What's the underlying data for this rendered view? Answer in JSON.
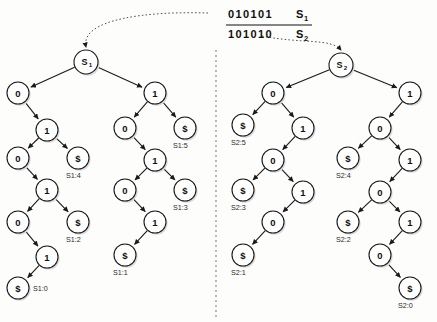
{
  "figure": {
    "width": 437,
    "height": 322,
    "colors": {
      "ink": "#1a1a1a",
      "shadow": "#d9d9d9",
      "divider": "#777777",
      "background": "#fdfdfc"
    }
  },
  "header": {
    "string1": {
      "bits": "010101",
      "name": "S",
      "sub": "1"
    },
    "string2": {
      "bits": "101010",
      "name": "S",
      "sub": "2"
    }
  },
  "roots": {
    "left": {
      "name": "S",
      "sub": "1"
    },
    "right": {
      "name": "S",
      "sub": "2"
    }
  },
  "tree_left": {
    "id": "S1",
    "nodes": [
      {
        "id": "L-root",
        "label": "S1",
        "x": 86,
        "y": 62,
        "r": 12,
        "kind": "root"
      },
      {
        "id": "L-a",
        "label": "0",
        "x": 18,
        "y": 93,
        "r": 11,
        "kind": "internal"
      },
      {
        "id": "L-b",
        "label": "1",
        "x": 47,
        "y": 130,
        "r": 11,
        "kind": "internal"
      },
      {
        "id": "L-c",
        "label": "0",
        "x": 18,
        "y": 158,
        "r": 11,
        "kind": "internal"
      },
      {
        "id": "L-d",
        "label": "$",
        "x": 78,
        "y": 158,
        "r": 11,
        "kind": "leaf",
        "leaf_label": "S1:4"
      },
      {
        "id": "L-e",
        "label": "1",
        "x": 47,
        "y": 190,
        "r": 11,
        "kind": "internal"
      },
      {
        "id": "L-f",
        "label": "0",
        "x": 18,
        "y": 222,
        "r": 11,
        "kind": "internal"
      },
      {
        "id": "L-g",
        "label": "$",
        "x": 78,
        "y": 222,
        "r": 11,
        "kind": "leaf",
        "leaf_label": "S1:2"
      },
      {
        "id": "L-h",
        "label": "1",
        "x": 47,
        "y": 257,
        "r": 11,
        "kind": "internal"
      },
      {
        "id": "L-i",
        "label": "$",
        "x": 18,
        "y": 288,
        "r": 11,
        "kind": "leaf",
        "leaf_label": "S1:0"
      },
      {
        "id": "R-a",
        "label": "1",
        "x": 155,
        "y": 93,
        "r": 11,
        "kind": "internal"
      },
      {
        "id": "R-b",
        "label": "0",
        "x": 125,
        "y": 128,
        "r": 11,
        "kind": "internal"
      },
      {
        "id": "R-c",
        "label": "$",
        "x": 185,
        "y": 128,
        "r": 11,
        "kind": "leaf",
        "leaf_label": "S1:5"
      },
      {
        "id": "R-d",
        "label": "1",
        "x": 155,
        "y": 160,
        "r": 11,
        "kind": "internal"
      },
      {
        "id": "R-e",
        "label": "0",
        "x": 125,
        "y": 190,
        "r": 11,
        "kind": "internal"
      },
      {
        "id": "R-f",
        "label": "$",
        "x": 185,
        "y": 190,
        "r": 11,
        "kind": "leaf",
        "leaf_label": "S1:3"
      },
      {
        "id": "R-g",
        "label": "1",
        "x": 155,
        "y": 222,
        "r": 11,
        "kind": "internal"
      },
      {
        "id": "R-h",
        "label": "$",
        "x": 125,
        "y": 255,
        "r": 11,
        "kind": "leaf",
        "leaf_label": "S1:1"
      }
    ],
    "edges": [
      [
        "L-root",
        "L-a"
      ],
      [
        "L-root",
        "R-a"
      ],
      [
        "L-a",
        "L-b"
      ],
      [
        "L-b",
        "L-c"
      ],
      [
        "L-b",
        "L-d"
      ],
      [
        "L-c",
        "L-e"
      ],
      [
        "L-e",
        "L-f"
      ],
      [
        "L-e",
        "L-g"
      ],
      [
        "L-f",
        "L-h"
      ],
      [
        "L-h",
        "L-i"
      ],
      [
        "R-a",
        "R-b"
      ],
      [
        "R-a",
        "R-c"
      ],
      [
        "R-b",
        "R-d"
      ],
      [
        "R-d",
        "R-e"
      ],
      [
        "R-d",
        "R-f"
      ],
      [
        "R-e",
        "R-g"
      ],
      [
        "R-g",
        "R-h"
      ]
    ]
  },
  "tree_right": {
    "id": "S2",
    "nodes": [
      {
        "id": "X-root",
        "label": "S2",
        "x": 341,
        "y": 65,
        "r": 12,
        "kind": "root"
      },
      {
        "id": "X-a",
        "label": "0",
        "x": 273,
        "y": 93,
        "r": 11,
        "kind": "internal"
      },
      {
        "id": "X-b",
        "label": "$",
        "x": 243,
        "y": 125,
        "r": 11,
        "kind": "leaf",
        "leaf_label": "S2:5"
      },
      {
        "id": "X-c",
        "label": "1",
        "x": 303,
        "y": 128,
        "r": 11,
        "kind": "internal"
      },
      {
        "id": "X-d",
        "label": "0",
        "x": 273,
        "y": 160,
        "r": 11,
        "kind": "internal"
      },
      {
        "id": "X-e",
        "label": "$",
        "x": 243,
        "y": 190,
        "r": 11,
        "kind": "leaf",
        "leaf_label": "S2:3"
      },
      {
        "id": "X-f",
        "label": "1",
        "x": 303,
        "y": 192,
        "r": 11,
        "kind": "internal"
      },
      {
        "id": "X-g",
        "label": "0",
        "x": 273,
        "y": 222,
        "r": 11,
        "kind": "internal"
      },
      {
        "id": "X-h",
        "label": "$",
        "x": 243,
        "y": 255,
        "r": 11,
        "kind": "leaf",
        "leaf_label": "S2:1"
      },
      {
        "id": "Y-a",
        "label": "1",
        "x": 410,
        "y": 93,
        "r": 11,
        "kind": "internal"
      },
      {
        "id": "Y-b",
        "label": "0",
        "x": 380,
        "y": 128,
        "r": 11,
        "kind": "internal"
      },
      {
        "id": "Y-c",
        "label": "$",
        "x": 348,
        "y": 158,
        "r": 11,
        "kind": "leaf",
        "leaf_label": "S2:4"
      },
      {
        "id": "Y-d",
        "label": "1",
        "x": 410,
        "y": 160,
        "r": 11,
        "kind": "internal"
      },
      {
        "id": "Y-e",
        "label": "0",
        "x": 380,
        "y": 192,
        "r": 11,
        "kind": "internal"
      },
      {
        "id": "Y-f",
        "label": "$",
        "x": 348,
        "y": 222,
        "r": 11,
        "kind": "leaf",
        "leaf_label": "S2:2"
      },
      {
        "id": "Y-g",
        "label": "1",
        "x": 410,
        "y": 222,
        "r": 11,
        "kind": "internal"
      },
      {
        "id": "Y-h",
        "label": "0",
        "x": 380,
        "y": 255,
        "r": 11,
        "kind": "internal"
      },
      {
        "id": "Y-i",
        "label": "$",
        "x": 410,
        "y": 288,
        "r": 11,
        "kind": "leaf",
        "leaf_label": "S2:0"
      }
    ],
    "edges": [
      [
        "X-root",
        "X-a"
      ],
      [
        "X-root",
        "Y-a"
      ],
      [
        "X-a",
        "X-b"
      ],
      [
        "X-a",
        "X-c"
      ],
      [
        "X-c",
        "X-d"
      ],
      [
        "X-d",
        "X-e"
      ],
      [
        "X-d",
        "X-f"
      ],
      [
        "X-f",
        "X-g"
      ],
      [
        "X-g",
        "X-h"
      ],
      [
        "Y-a",
        "Y-b"
      ],
      [
        "Y-b",
        "Y-c"
      ],
      [
        "Y-b",
        "Y-d"
      ],
      [
        "Y-d",
        "Y-e"
      ],
      [
        "Y-e",
        "Y-f"
      ],
      [
        "Y-e",
        "Y-g"
      ],
      [
        "Y-g",
        "Y-h"
      ],
      [
        "Y-h",
        "Y-i"
      ]
    ]
  },
  "divider": {
    "x": 216,
    "y1": 50,
    "y2": 320
  },
  "pointers": [
    {
      "name": "pointer-to-s1",
      "from_x": 208,
      "from_y": 13,
      "to_x": 86,
      "to_y": 47
    },
    {
      "name": "pointer-to-s2",
      "from_x": 262,
      "from_y": 36,
      "to_x": 341,
      "to_y": 50
    }
  ]
}
